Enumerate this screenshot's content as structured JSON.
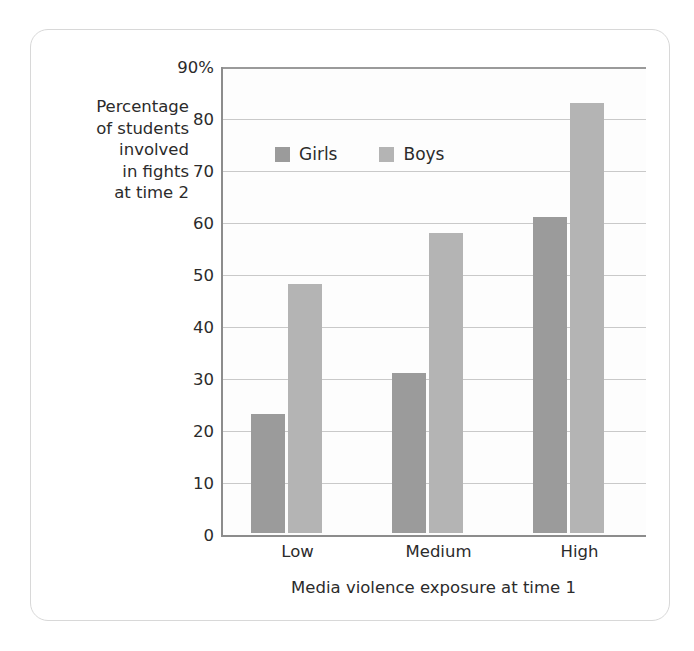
{
  "chart_data": {
    "type": "bar",
    "title": "",
    "categories": [
      "Low",
      "Medium",
      "High"
    ],
    "series": [
      {
        "name": "Girls",
        "values": [
          23,
          31,
          61
        ],
        "color": "#9b9b9b"
      },
      {
        "name": "Boys",
        "values": [
          48,
          58,
          83
        ],
        "color": "#b4b4b4"
      }
    ],
    "xlabel": "Media violence exposure at time 1",
    "ylabel": "Percentage of students involved in fights at time 2",
    "ylabel_lines": [
      "Percentage",
      "of students",
      "involved",
      "in fights",
      "at time 2"
    ],
    "ylim": [
      0,
      90
    ],
    "ytick_values": [
      90,
      80,
      70,
      60,
      50,
      40,
      30,
      20,
      10,
      0
    ],
    "ytick_labels": [
      "90%",
      "80",
      "70",
      "60",
      "50",
      "40",
      "30",
      "20",
      "10",
      "0"
    ],
    "grid": true,
    "legend_position": "upper-left-inside",
    "legend_entries": [
      "Girls",
      "Boys"
    ]
  },
  "axis": {
    "y_title_lines": [
      "Percentage",
      "of students",
      "involved",
      "in fights",
      "at time 2"
    ],
    "x_title": "Media violence exposure at time 1",
    "y_ticks": [
      "90%",
      "80",
      "70",
      "60",
      "50",
      "40",
      "30",
      "20",
      "10",
      "0"
    ],
    "x_ticks": [
      "Low",
      "Medium",
      "High"
    ]
  },
  "legend": {
    "items": [
      {
        "label": "Girls",
        "color": "#9b9b9b"
      },
      {
        "label": "Boys",
        "color": "#b4b4b4"
      }
    ]
  },
  "colors": {
    "girls": "#9b9b9b",
    "boys": "#b4b4b4",
    "axis": "#8c8c8c",
    "grid": "#c9c9c9",
    "text": "#2b2b2b",
    "card_border": "#d8d8d8"
  }
}
